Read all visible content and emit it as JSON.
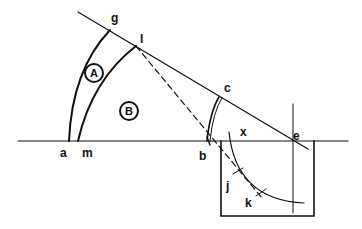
{
  "diagram": {
    "type": "geometric construction",
    "stroke_color": "#111111",
    "background": "#ffffff",
    "points": {
      "a": "a",
      "m": "m",
      "g": "g",
      "l": "l",
      "c": "c",
      "b": "b",
      "e": "e",
      "x": "x",
      "j": "j",
      "k": "k"
    },
    "regions": {
      "A": "A",
      "B": "B"
    },
    "elements": [
      "horizontal baseline through a, m, b, e",
      "inclined line from g through l, c to e",
      "arc a-g (outer)",
      "arc m-l (inner)",
      "double arc b-c",
      "dashed line l to b continuing into box",
      "arc x through j, k inside box",
      "vertical line through e",
      "rectangular box below baseline"
    ]
  }
}
